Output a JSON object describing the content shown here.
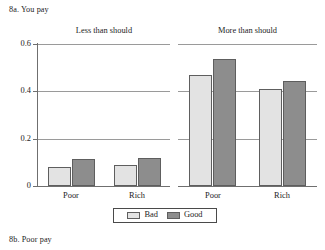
{
  "figure": {
    "caption_top": "8a. You pay",
    "caption_bottom": "8b. Poor pay"
  },
  "colors": {
    "bad": "#e3e3e3",
    "good": "#8d8d8d",
    "bar_stroke": "#5e5e5e",
    "grid": "#9a9a9a",
    "axis": "#6f6f6f",
    "text": "#1d1d1d",
    "background": "#ffffff"
  },
  "chart_data": {
    "type": "bar",
    "title": "8a. You pay",
    "xlabel": "",
    "ylabel": "",
    "ylim": [
      0,
      0.6
    ],
    "yticks": [
      "0",
      "0.2",
      "0.4",
      "0.6"
    ],
    "ytick_values": [
      0,
      0.2,
      0.4,
      0.6
    ],
    "grid": true,
    "grid_axis": "y",
    "legend_position": "bottom-center",
    "panels": [
      {
        "name": "Less than should",
        "categories": [
          "Poor",
          "Rich"
        ],
        "series": [
          {
            "name": "Bad",
            "values": [
              0.08,
              0.09
            ]
          },
          {
            "name": "Good",
            "values": [
              0.115,
              0.12
            ]
          }
        ]
      },
      {
        "name": "More than should",
        "categories": [
          "Poor",
          "Rich"
        ],
        "series": [
          {
            "name": "Bad",
            "values": [
              0.47,
              0.41
            ]
          },
          {
            "name": "Good",
            "values": [
              0.535,
              0.445
            ]
          }
        ]
      }
    ],
    "legend": [
      {
        "label": "Bad",
        "color": "#e3e3e3"
      },
      {
        "label": "Good",
        "color": "#8d8d8d"
      }
    ]
  }
}
